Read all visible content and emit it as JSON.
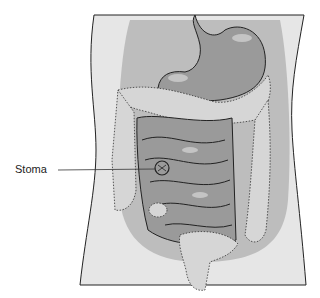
{
  "figure": {
    "labels": [
      {
        "id": "stoma",
        "text": "Stoma",
        "x": 15,
        "y": 164
      }
    ]
  },
  "colors": {
    "background": "#ffffff",
    "torso": "#e6e6e6",
    "abdominal_cavity": "#bdbdbd",
    "organs": "#9a9a9a",
    "organ_highlight": "#c4c4c4",
    "colon": "#d6d6d6",
    "outline": "#222222"
  }
}
